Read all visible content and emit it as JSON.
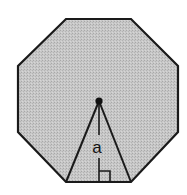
{
  "diagram": {
    "shape": "regular-octagon",
    "fill": "#c4c4c4",
    "stroke": "#1a1a1a",
    "apothem_label": "a",
    "elements": [
      "octagon",
      "center-point",
      "central-triangle",
      "apothem",
      "right-angle-marker"
    ]
  }
}
